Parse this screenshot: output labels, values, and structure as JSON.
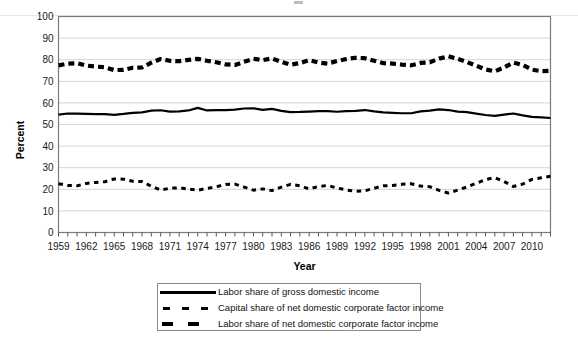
{
  "chart_data": {
    "type": "line",
    "title": "",
    "xlabel": "Year",
    "ylabel": "Percent",
    "ylim": [
      0,
      100
    ],
    "ytick_step": 10,
    "yticks": [
      0,
      10,
      20,
      30,
      40,
      50,
      60,
      70,
      80,
      90,
      100
    ],
    "xlim": [
      1959,
      2012
    ],
    "xtick_step": 3,
    "xticks": [
      1959,
      1962,
      1965,
      1968,
      1971,
      1974,
      1977,
      1980,
      1983,
      1986,
      1989,
      1992,
      1995,
      1998,
      2001,
      2004,
      2007,
      2010
    ],
    "grid": "horizontal",
    "legend_position": "bottom-center-boxed",
    "x": [
      1959,
      1960,
      1961,
      1962,
      1963,
      1964,
      1965,
      1966,
      1967,
      1968,
      1969,
      1970,
      1971,
      1972,
      1973,
      1974,
      1975,
      1976,
      1977,
      1978,
      1979,
      1980,
      1981,
      1982,
      1983,
      1984,
      1985,
      1986,
      1987,
      1988,
      1989,
      1990,
      1991,
      1992,
      1993,
      1994,
      1995,
      1996,
      1997,
      1998,
      1999,
      2000,
      2001,
      2002,
      2003,
      2004,
      2005,
      2006,
      2007,
      2008,
      2009,
      2010,
      2011,
      2012
    ],
    "series": [
      {
        "name": "Labor share of gross domestic income",
        "style": "solid",
        "color": "#000000",
        "values": [
          54.6,
          55.1,
          55.0,
          54.9,
          54.8,
          54.8,
          54.5,
          54.9,
          55.4,
          55.6,
          56.4,
          56.6,
          56.0,
          56.1,
          56.5,
          57.7,
          56.5,
          56.7,
          56.7,
          56.9,
          57.4,
          57.5,
          56.8,
          57.2,
          56.3,
          55.7,
          55.8,
          56.0,
          56.2,
          56.2,
          55.9,
          56.2,
          56.3,
          56.7,
          56.1,
          55.6,
          55.4,
          55.2,
          55.2,
          56.1,
          56.4,
          57.0,
          56.7,
          56.0,
          55.7,
          55.0,
          54.4,
          54.0,
          54.6,
          55.1,
          54.2,
          53.5,
          53.3,
          53.0
        ]
      },
      {
        "name": "Capital share of net domestic corporate factor income",
        "style": "dotted",
        "color": "#000000",
        "values": [
          22.6,
          21.8,
          21.6,
          22.7,
          23.2,
          23.5,
          24.8,
          24.7,
          23.7,
          23.6,
          21.4,
          19.7,
          20.5,
          20.7,
          20.1,
          19.6,
          20.4,
          21.2,
          22.2,
          22.4,
          21.0,
          19.6,
          20.2,
          19.4,
          21.0,
          22.3,
          21.6,
          20.2,
          21.3,
          21.8,
          20.6,
          19.7,
          19.1,
          19.3,
          20.5,
          21.6,
          21.8,
          22.3,
          22.6,
          21.5,
          21.2,
          19.5,
          18.3,
          19.6,
          21.1,
          22.8,
          24.5,
          25.4,
          23.6,
          21.3,
          22.4,
          24.6,
          25.3,
          26.0
        ]
      },
      {
        "name": "Labor share of net domestic corporate factor income",
        "style": "dashed",
        "color": "#000000",
        "values": [
          77.4,
          78.2,
          78.4,
          77.3,
          76.8,
          76.5,
          75.2,
          75.3,
          76.3,
          76.4,
          78.6,
          80.3,
          79.5,
          79.3,
          79.9,
          80.4,
          79.5,
          78.8,
          77.8,
          77.6,
          79.0,
          80.4,
          79.8,
          80.6,
          79.0,
          77.7,
          78.4,
          79.8,
          78.7,
          78.2,
          79.4,
          80.3,
          80.9,
          80.7,
          79.5,
          78.4,
          78.2,
          77.7,
          77.4,
          78.5,
          78.8,
          80.5,
          81.6,
          80.4,
          78.9,
          77.2,
          75.5,
          74.6,
          76.4,
          78.7,
          77.6,
          75.4,
          74.7,
          74.9
        ]
      }
    ]
  },
  "legend": {
    "items": [
      {
        "label": "Labor share of gross domestic income",
        "key": "solid-line-key"
      },
      {
        "label": "Capital share of net domestic corporate factor income",
        "key": "dotted-line-key"
      },
      {
        "label": "Labor share of net domestic corporate factor income",
        "key": "dashed-line-key"
      }
    ]
  },
  "axes": {
    "y_title": "Percent",
    "x_title": "Year"
  }
}
